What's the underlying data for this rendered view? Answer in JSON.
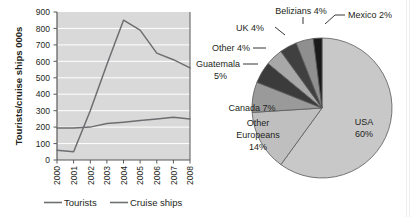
{
  "chart_data": [
    {
      "type": "line",
      "title": "",
      "xlabel": "",
      "ylabel": "Tourists/cruise ships 000s",
      "x": [
        "2000",
        "2001",
        "2002",
        "2003",
        "2004",
        "2005",
        "2006",
        "2007",
        "2008"
      ],
      "ylim": [
        0,
        900
      ],
      "yticks": [
        0,
        100,
        200,
        300,
        400,
        500,
        600,
        700,
        800,
        900
      ],
      "grid": true,
      "legend_position": "bottom",
      "series": [
        {
          "name": "Tourists",
          "values": [
            195,
            195,
            200,
            222,
            230,
            240,
            250,
            260,
            250
          ],
          "color": "#6d6e71"
        },
        {
          "name": "Cruise ships",
          "values": [
            60,
            50,
            300,
            580,
            850,
            790,
            650,
            610,
            560
          ],
          "color": "#6d6e71"
        }
      ]
    },
    {
      "type": "pie",
      "title": "",
      "slices": [
        {
          "label": "USA",
          "percent": 60,
          "text": "USA 60%",
          "color": "#c8c8c8"
        },
        {
          "label": "Other Europeans",
          "percent": 14,
          "text": "Other Europeans 14%",
          "color": "#bfbfbf"
        },
        {
          "label": "Canada",
          "percent": 7,
          "text": "Canada 7%",
          "color": "#9a9a9a"
        },
        {
          "label": "Guatemala",
          "percent": 5,
          "text": "Guatemala 5%",
          "color": "#3b3b3b"
        },
        {
          "label": "Other",
          "percent": 4,
          "text": "Other 4%",
          "color": "#a8a8a8"
        },
        {
          "label": "UK",
          "percent": 4,
          "text": "UK 4%",
          "color": "#404040"
        },
        {
          "label": "Belizians",
          "percent": 4,
          "text": "Belizians 4%",
          "color": "#8f8f8f"
        },
        {
          "label": "Mexico",
          "percent": 2,
          "text": "Mexico 2%",
          "color": "#1a1a1a"
        }
      ]
    }
  ],
  "line_chart": {
    "y_axis_title": "Tourists/cruise ships 000s",
    "y_ticks": [
      "900",
      "800",
      "700",
      "600",
      "500",
      "400",
      "300",
      "200",
      "100",
      "0"
    ],
    "x_ticks": [
      "2000",
      "2001",
      "2002",
      "2003",
      "2004",
      "2005",
      "2006",
      "2007",
      "2008"
    ],
    "legend": [
      {
        "label": "Tourists"
      },
      {
        "label": "Cruise ships"
      }
    ]
  },
  "pie_chart": {
    "labels": {
      "usa": "USA",
      "usa_pct": "60%",
      "other_europeans_1": "Other",
      "other_europeans_2": "Europeans",
      "other_europeans_pct": "14%",
      "canada": "Canada 7%",
      "guatemala_1": "Guatemala",
      "guatemala_2": "5%",
      "other": "Other 4%",
      "uk": "UK 4%",
      "belizians": "Belizians 4%",
      "mexico": "Mexico 2%"
    }
  },
  "colors": {
    "plot_background": "#d9d9d9",
    "gridline": "#ffffff",
    "axis": "#58595b",
    "line": "#6d6e71",
    "text": "#231f20",
    "pie_outline": "#58595b"
  }
}
